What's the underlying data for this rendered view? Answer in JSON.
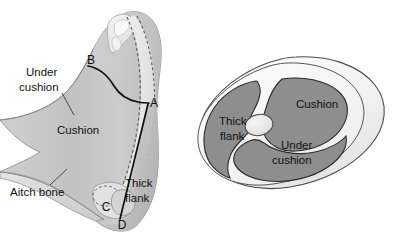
{
  "figure": {
    "background_color": "#ffffff",
    "panels": [
      "side-view",
      "cross-section"
    ]
  },
  "colors": {
    "flesh_mid": "#c4c4c4",
    "flesh_light": "#dcdcdc",
    "flesh_lighter": "#e9e9e9",
    "bone_light": "#efefef",
    "muscle_gray": "#8e8e8e",
    "muscle_outline": "#2b2b2b",
    "rim_white": "#fbfbfb",
    "rim_shadow": "#e4e4e4",
    "line_dark": "#111111",
    "leader_line": "#3a3a3a",
    "dash_line": "#5e5e5e"
  },
  "side_view": {
    "name": "side-view-panel",
    "labels": {
      "under_cushion": "Under\ncushion",
      "under_cushion_line1": "Under",
      "under_cushion_line2": "cushion",
      "cushion": "Cushion",
      "aitch_bone": "Aitch bone",
      "thick_flank_line1": "Thick",
      "thick_flank_line2": "flank"
    },
    "points": [
      {
        "id": "A",
        "label": "A",
        "x": 147,
        "y": 103
      },
      {
        "id": "B",
        "label": "B",
        "x": 92,
        "y": 62
      },
      {
        "id": "C",
        "label": "C",
        "x": 107,
        "y": 207
      },
      {
        "id": "D",
        "label": "D",
        "x": 122,
        "y": 224
      }
    ],
    "cut_lines": [
      {
        "name": "cut-b-to-a",
        "from": "B",
        "to": "A"
      },
      {
        "name": "cut-a-to-d",
        "from": "A",
        "to": "D"
      }
    ]
  },
  "cross_section": {
    "name": "cross-section-panel",
    "muscles": [
      {
        "id": "cushion",
        "label": "Cushion",
        "label_x": 321,
        "label_y": 105
      },
      {
        "id": "under-cushion",
        "label_line1": "Under",
        "label_line2": "cushion",
        "label_x": 311,
        "label_y": 147
      },
      {
        "id": "thick-flank",
        "label_line1": "Thick",
        "label_line2": "flank",
        "label_x": 241,
        "label_y": 127
      }
    ],
    "bone": {
      "id": "center-bone",
      "name": "femur-cross-section"
    }
  }
}
